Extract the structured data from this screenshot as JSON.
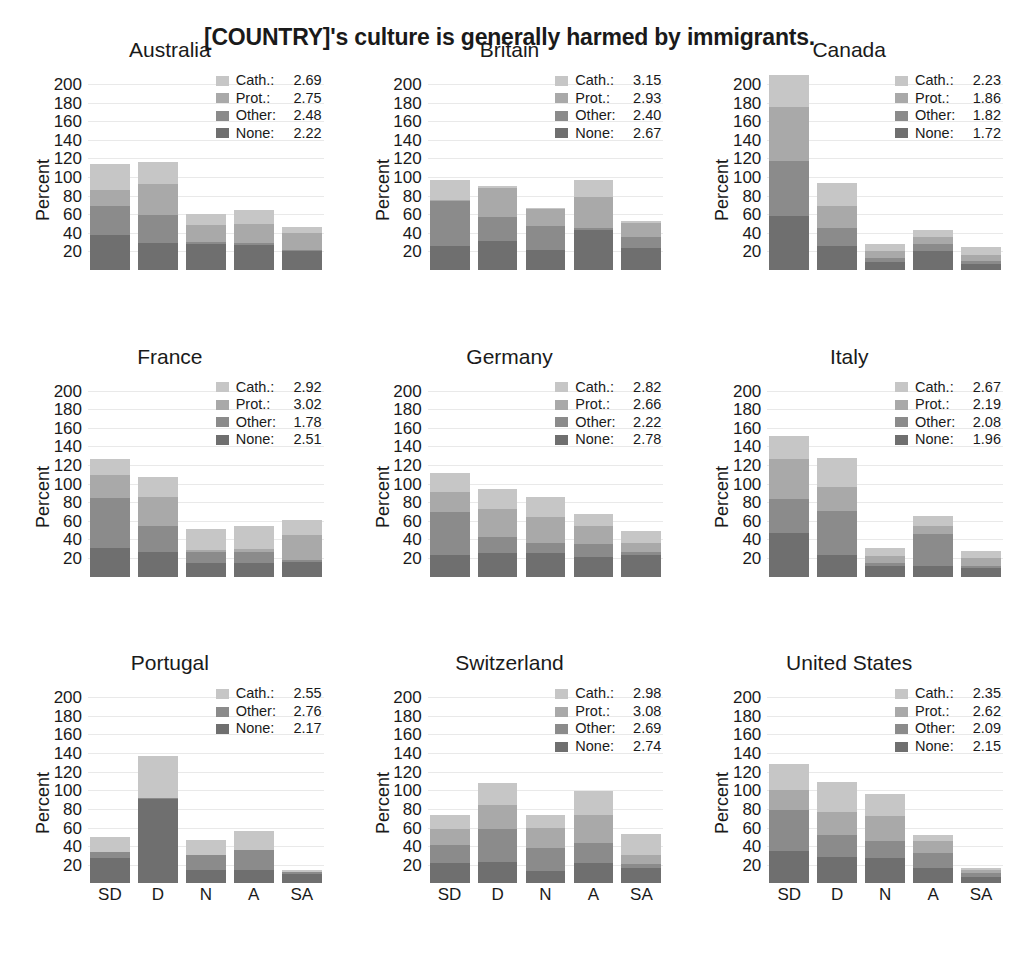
{
  "title": "[COUNTRY]'s culture is generally harmed by immigrants.",
  "axis": {
    "ylabel": "Percent",
    "yticks": [
      200,
      180,
      160,
      140,
      120,
      100,
      80,
      60,
      40,
      20
    ],
    "ylim": [
      0,
      215
    ],
    "xcategories": [
      "SD",
      "D",
      "N",
      "A",
      "SA"
    ]
  },
  "colors": {
    "Cath.": "#c6c6c6",
    "Prot.": "#a9a9a9",
    "Other": "#8b8b8b",
    "None": "#6f6f6f"
  },
  "chart_data": {
    "type": "bar",
    "subtype": "stacked-bar-small-multiples",
    "title": "[COUNTRY]'s culture is generally harmed by immigrants.",
    "xlabel": "",
    "ylabel": "Percent",
    "ylim": [
      0,
      215
    ],
    "grid": true,
    "legend_position": "top-right inside each panel",
    "categories": [
      "SD",
      "D",
      "N",
      "A",
      "SA"
    ],
    "panels": [
      {
        "name": "Australia",
        "legend": [
          {
            "name": "Cath.",
            "mean": 2.69
          },
          {
            "name": "Prot.",
            "mean": 2.75
          },
          {
            "name": "Other",
            "mean": 2.48
          },
          {
            "name": "None",
            "mean": 2.22
          }
        ],
        "series": [
          {
            "name": "None",
            "values": [
              38,
              29,
              28,
              27,
              20
            ]
          },
          {
            "name": "Other",
            "values": [
              31,
              30,
              2,
              2,
              1
            ]
          },
          {
            "name": "Prot.",
            "values": [
              17,
              33,
              18,
              21,
              19
            ]
          },
          {
            "name": "Cath.",
            "values": [
              28,
              24,
              12,
              15,
              6
            ]
          }
        ],
        "totals": [
          114,
          116,
          60,
          65,
          46
        ]
      },
      {
        "name": "Britain",
        "legend": [
          {
            "name": "Cath.",
            "mean": 3.15
          },
          {
            "name": "Prot.",
            "mean": 2.93
          },
          {
            "name": "Other",
            "mean": 2.4
          },
          {
            "name": "None",
            "mean": 2.67
          }
        ],
        "series": [
          {
            "name": "None",
            "values": [
              26,
              31,
              22,
              43,
              24
            ]
          },
          {
            "name": "Other",
            "values": [
              48,
              26,
              25,
              2,
              12
            ]
          },
          {
            "name": "Prot.",
            "values": [
              1,
              31,
              19,
              33,
              15
            ]
          },
          {
            "name": "Cath.",
            "values": [
              22,
              2,
              1,
              19,
              2
            ]
          }
        ],
        "totals": [
          97,
          90,
          67,
          97,
          53
        ]
      },
      {
        "name": "Canada",
        "legend": [
          {
            "name": "Cath.",
            "mean": 2.23
          },
          {
            "name": "Prot.",
            "mean": 1.86
          },
          {
            "name": "Other",
            "mean": 1.82
          },
          {
            "name": "None",
            "mean": 1.72
          }
        ],
        "series": [
          {
            "name": "None",
            "values": [
              58,
              26,
              9,
              20,
              7
            ]
          },
          {
            "name": "Other",
            "values": [
              59,
              19,
              4,
              8,
              3
            ]
          },
          {
            "name": "Prot.",
            "values": [
              58,
              24,
              7,
              7,
              6
            ]
          },
          {
            "name": "Cath.",
            "values": [
              35,
              25,
              8,
              8,
              9
            ]
          }
        ],
        "totals": [
          210,
          94,
          28,
          43,
          25
        ]
      },
      {
        "name": "France",
        "legend": [
          {
            "name": "Cath.",
            "mean": 2.92
          },
          {
            "name": "Prot.",
            "mean": 3.02
          },
          {
            "name": "Other",
            "mean": 1.78
          },
          {
            "name": "None",
            "mean": 2.51
          }
        ],
        "series": [
          {
            "name": "None",
            "values": [
              31,
              27,
              15,
              15,
              16
            ]
          },
          {
            "name": "Other",
            "values": [
              54,
              27,
              11,
              12,
              2
            ]
          },
          {
            "name": "Prot.",
            "values": [
              24,
              32,
              3,
              3,
              27
            ]
          },
          {
            "name": "Cath.",
            "values": [
              17,
              21,
              22,
              24,
              16
            ]
          }
        ],
        "totals": [
          126,
          107,
          51,
          54,
          61
        ]
      },
      {
        "name": "Germany",
        "legend": [
          {
            "name": "Cath.",
            "mean": 2.82
          },
          {
            "name": "Prot.",
            "mean": 2.66
          },
          {
            "name": "Other",
            "mean": 2.22
          },
          {
            "name": "None",
            "mean": 2.78
          }
        ],
        "series": [
          {
            "name": "None",
            "values": [
              23,
              25,
              25,
              21,
              23
            ]
          },
          {
            "name": "Other",
            "values": [
              46,
              18,
              11,
              14,
              3
            ]
          },
          {
            "name": "Prot.",
            "values": [
              22,
              30,
              28,
              19,
              10
            ]
          },
          {
            "name": "Cath.",
            "values": [
              20,
              21,
              22,
              13,
              13
            ]
          }
        ],
        "totals": [
          111,
          94,
          86,
          67,
          49
        ]
      },
      {
        "name": "Italy",
        "legend": [
          {
            "name": "Cath.",
            "mean": 2.67
          },
          {
            "name": "Prot.",
            "mean": 2.19
          },
          {
            "name": "Other",
            "mean": 2.08
          },
          {
            "name": "None",
            "mean": 1.96
          }
        ],
        "series": [
          {
            "name": "None",
            "values": [
              47,
              23,
              11,
              11,
              9
            ]
          },
          {
            "name": "Other",
            "values": [
              36,
              48,
              4,
              35,
              3
            ]
          },
          {
            "name": "Prot.",
            "values": [
              44,
              25,
              7,
              8,
              8
            ]
          },
          {
            "name": "Cath.",
            "values": [
              24,
              32,
              9,
              11,
              8
            ]
          }
        ],
        "totals": [
          151,
          128,
          31,
          65,
          28
        ]
      },
      {
        "name": "Portugal",
        "legend": [
          {
            "name": "Cath.",
            "mean": 2.55
          },
          {
            "name": "Other",
            "mean": 2.76
          },
          {
            "name": "None",
            "mean": 2.17
          }
        ],
        "series": [
          {
            "name": "None",
            "values": [
              27,
              91,
              14,
              14,
              10
            ]
          },
          {
            "name": "Other",
            "values": [
              7,
              1,
              17,
              22,
              2
            ]
          },
          {
            "name": "Prot.",
            "values": [
              0,
              0,
              0,
              0,
              0
            ]
          },
          {
            "name": "Cath.",
            "values": [
              16,
              45,
              16,
              20,
              2
            ]
          }
        ],
        "totals": [
          50,
          137,
          47,
          56,
          14
        ]
      },
      {
        "name": "Switzerland",
        "legend": [
          {
            "name": "Cath.",
            "mean": 2.98
          },
          {
            "name": "Prot.",
            "mean": 3.08
          },
          {
            "name": "Other",
            "mean": 2.69
          },
          {
            "name": "None",
            "mean": 2.74
          }
        ],
        "series": [
          {
            "name": "None",
            "values": [
              22,
              23,
              13,
              22,
              17
            ]
          },
          {
            "name": "Other",
            "values": [
              19,
              35,
              25,
              21,
              4
            ]
          },
          {
            "name": "Prot.",
            "values": [
              17,
              26,
              21,
              31,
              10
            ]
          },
          {
            "name": "Cath.",
            "values": [
              15,
              24,
              14,
              25,
              22
            ]
          }
        ],
        "totals": [
          73,
          108,
          73,
          99,
          53
        ]
      },
      {
        "name": "United States",
        "legend": [
          {
            "name": "Cath.",
            "mean": 2.35
          },
          {
            "name": "Prot.",
            "mean": 2.62
          },
          {
            "name": "Other",
            "mean": 2.09
          },
          {
            "name": "None",
            "mean": 2.15
          }
        ],
        "series": [
          {
            "name": "None",
            "values": [
              35,
              28,
              27,
              16,
              7
            ]
          },
          {
            "name": "Other",
            "values": [
              44,
              24,
              19,
              17,
              4
            ]
          },
          {
            "name": "Prot.",
            "values": [
              21,
              25,
              26,
              12,
              3
            ]
          },
          {
            "name": "Cath.",
            "values": [
              28,
              32,
              24,
              7,
              2
            ]
          }
        ],
        "totals": [
          128,
          109,
          96,
          52,
          16
        ]
      }
    ]
  }
}
